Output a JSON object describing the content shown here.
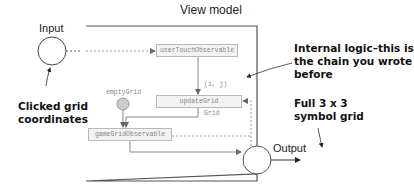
{
  "title": "View model",
  "input_label": "Input",
  "output_label": "Output",
  "nodes": {
    "user_touch": "userTouchObservable",
    "update_grid": "updateGrid",
    "game_grid": "gameGridObservable",
    "empty_grid": "emptyGrid"
  },
  "edge_labels": {
    "ij": "(i, j)",
    "grid": "Grid"
  },
  "annotations": {
    "clicked_line1": "Clicked grid",
    "clicked_line2": "coordinates",
    "internal_line1": "Internal logic–this is",
    "internal_line2": "the chain you wrote",
    "internal_line3": "before",
    "full_line1": "Full 3 x 3",
    "full_line2": "symbol grid"
  },
  "colors": {
    "frame": "#555555",
    "box_fill": "#f2f2f2",
    "box_border": "#b8b8b8",
    "line": "#888888",
    "empty_grid_fill": "#cccccc"
  }
}
